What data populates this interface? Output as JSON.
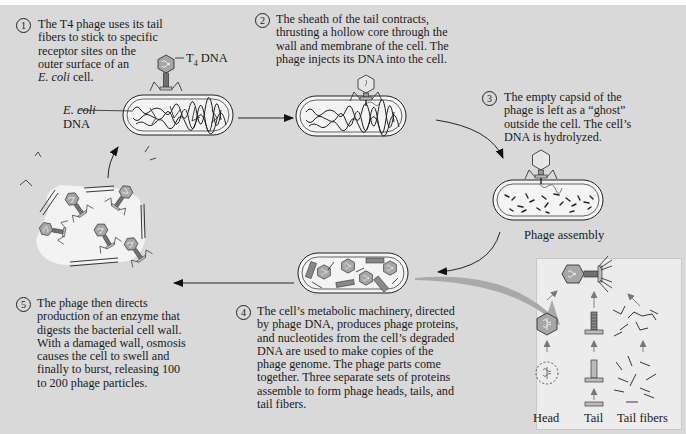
{
  "diagram": {
    "steps": [
      {
        "number": "1",
        "text": "The T4 phage uses its tail fibers to stick to specific receptor sites on the outer surface of an E. coli cell.",
        "lines": [
          "The T4 phage uses its tail",
          "fibers to stick to specific",
          "receptor sites on the",
          "outer surface of an"
        ],
        "last_line_italic": "E. coli",
        "last_line_rest": " cell."
      },
      {
        "number": "2",
        "text": "The sheath of the tail contracts, thrusting a hollow core through the wall and membrane of the cell. The phage injects its DNA into the cell.",
        "lines": [
          "The sheath of the tail contracts,",
          "thrusting a hollow core through the",
          "wall and membrane of the cell. The",
          "phage injects its DNA into the cell."
        ]
      },
      {
        "number": "3",
        "text": "The empty capsid of the phage is left as a “ghost” outside the cell. The cell’s DNA is hydrolyzed.",
        "lines": [
          "The empty capsid of the",
          "phage is left as a “ghost”",
          "outside the cell. The cell’s",
          "DNA is hydrolyzed."
        ]
      },
      {
        "number": "4",
        "text": "The cell’s metabolic machinery, directed by phage DNA, produces phage proteins, and nucleotides from the cell’s degraded DNA are used to make copies of the phage genome. The phage parts come together. Three separate sets of proteins assemble to form phage heads, tails, and tail fibers.",
        "lines": [
          "The cell’s metabolic machinery, directed",
          "by phage DNA, produces phage proteins,",
          "and nucleotides from the cell’s degraded",
          "DNA are used to make copies of the",
          "phage genome. The phage parts come",
          "together. Three separate sets of proteins",
          "assemble to form phage heads, tails, and",
          "tail fibers."
        ]
      },
      {
        "number": "5",
        "text": "The phage then directs production of an enzyme that digests the bacterial cell wall. With a damaged wall, osmosis causes the cell to swell and finally to burst, releasing 100 to 200 phage particles.",
        "lines": [
          "The phage then directs",
          "production of an enzyme that",
          "digests the bacterial cell wall.",
          "With a damaged wall, osmosis",
          "causes the cell to swell and",
          "finally to burst, releasing 100",
          "to 200 phage particles."
        ]
      }
    ],
    "labels": {
      "t4_dna_prefix": "T",
      "t4_dna_sub": "4",
      "t4_dna_suffix": " DNA",
      "ecoli_italic": "E. coli",
      "ecoli_dna": "DNA",
      "phage_assembly": "Phage assembly",
      "head": "Head",
      "tail": "Tail",
      "tail_fibers": "Tail fibers"
    },
    "colors": {
      "background": "#d9d9d9",
      "inset": "#ececec",
      "capsid": "#a6a6a6",
      "ink": "#1a1a1a",
      "assembly_arrow": "#a9a9a9"
    }
  }
}
